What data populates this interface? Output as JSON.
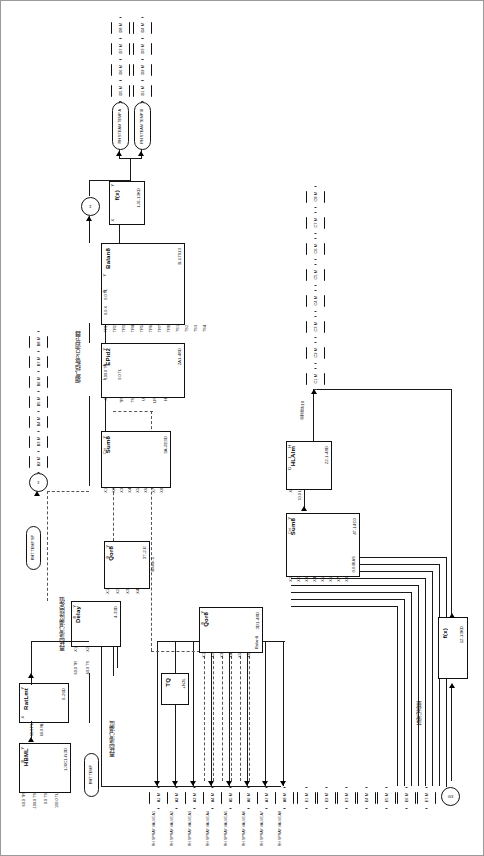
{
  "diagram": {
    "orientation_note": "sheet rotated 90°",
    "annotations": [
      {
        "id": "ann-pid",
        "text": "烟气挡板PID调节器"
      },
      {
        "id": "ann-setval",
        "text": "再热蒸汽温度给定值"
      },
      {
        "id": "ann-temp",
        "text": "再热蒸汽温度"
      },
      {
        "id": "ann-open",
        "text": "总开度<10"
      },
      {
        "id": "ann-load",
        "text": "蒸汽流量"
      }
    ]
  },
  "blocks": [
    {
      "id": "balan8",
      "name": "Balan8",
      "tag": "B-17013",
      "outputs": [
        "Y",
        "B"
      ],
      "inputs": [
        "TR1",
        "TR2",
        "TR3",
        "TR4",
        "TR5",
        "TR6",
        "TR7",
        "TR8",
        "TS1",
        "TS2",
        "TS3",
        "TS4",
        "TS5",
        "TS6",
        "TS7",
        "TS8"
      ],
      "params": [
        "0.0 TL",
        "0.0 X",
        "100.0",
        "100.0",
        "100.0",
        "100.0",
        "-100.0",
        "-100.0",
        "-100.0",
        "-100.0"
      ]
    },
    {
      "id": "epid2",
      "name": "EPid2",
      "tag": "2A1-48D",
      "outputs": [
        "Y",
        "A",
        "L"
      ],
      "inputs": [
        "X",
        "TR",
        "TS",
        "U",
        "LR",
        "H"
      ],
      "params": [
        "100.0 TS",
        "0.0 TL",
        "1.0 PB",
        "0.0 TI",
        "0.0 TD",
        "0.0 B"
      ]
    },
    {
      "id": "sum8a",
      "name": "Sum8",
      "tag": "3A-2E3D",
      "outputs": [
        "Y",
        "Cnt"
      ],
      "inputs": [
        "X1",
        "X2",
        "X3",
        "X4",
        "X5",
        "X6",
        "X7",
        "X8"
      ],
      "params": [
        "1.0 K1",
        "1.0 K2",
        "1.0 K3",
        "1.0 K4",
        "0.0 BIAS"
      ]
    },
    {
      "id": "sum8b",
      "name": "Sum8",
      "tag": "4T-14C0",
      "outputs": [
        "Y",
        "Cnt"
      ],
      "inputs": [
        "X1",
        "X2",
        "X3",
        "X4",
        "X5",
        "X6",
        "X7",
        "X8"
      ],
      "params": [
        "0.0 BIAS"
      ]
    },
    {
      "id": "hlalm",
      "name": "HLAlm",
      "tag": "22-1-48D",
      "outputs": [
        "H",
        "L",
        "D"
      ],
      "inputs": [
        "X"
      ],
      "params": [
        "10.0 L"
      ]
    },
    {
      "id": "qor8a",
      "name": "Qor8",
      "tag": "3T-2-E",
      "outputs": [
        "Y",
        "B"
      ],
      "inputs": [
        "X1",
        "X2",
        "X3",
        "X4"
      ],
      "params": [
        "Balan-1"
      ]
    },
    {
      "id": "qor8b",
      "name": "Qor8",
      "tag": "3D1-48D",
      "outputs": [
        "Y",
        "B"
      ],
      "inputs": [
        "X1",
        "X2",
        "X3",
        "X4",
        "X5",
        "X6"
      ],
      "params": [
        "Balan8"
      ]
    },
    {
      "id": "delay",
      "name": "Delay",
      "tag": "4-33D",
      "outputs": [
        "Y",
        "B"
      ],
      "inputs": [
        "X1",
        "X2"
      ],
      "params": [
        "60.0 TR",
        "-60.0 TS"
      ]
    },
    {
      "id": "ratlmt",
      "name": "RatLmt",
      "tag": "6-26D",
      "outputs": [
        "Y",
        "B"
      ],
      "inputs": [
        "X"
      ],
      "params": [
        "60.0 PL",
        "60.0 NL"
      ]
    },
    {
      "id": "hbml",
      "name": "HBML",
      "tag": "1J6C1-N3D",
      "outputs": [
        "Y",
        "B"
      ],
      "inputs": [
        "TR",
        "TS",
        "TS",
        "TL"
      ],
      "params": [
        "60.0",
        "-100.0",
        "0.0",
        "100.0"
      ]
    },
    {
      "id": "tq",
      "name": "TQ",
      "tag": "+N3L"
    },
    {
      "id": "fx1",
      "name": "f(x)",
      "tag": "1J6-13KD",
      "inputs": [
        "X"
      ],
      "outputs": [
        "Y"
      ]
    },
    {
      "id": "fx2",
      "name": "f(x)",
      "tag": "12-13KD",
      "inputs": [
        "X"
      ],
      "outputs": [
        "Y"
      ]
    },
    {
      "id": "sumcircle",
      "name": "Σ"
    }
  ],
  "pill_tags": [
    {
      "id": "pill-a",
      "text": "RH STEAM TEMP A"
    },
    {
      "id": "pill-b",
      "text": "RH STEAM TEMP B"
    },
    {
      "id": "pill-c",
      "text": "RHT TEMP SP"
    },
    {
      "id": "pill-d",
      "text": "RHT TEMP"
    }
  ],
  "hex_groups": [
    {
      "id": "hex-col-top-left",
      "tags": [
        {
          "label": "D8 M"
        },
        {
          "label": "D7 M"
        },
        {
          "label": "D6 M"
        },
        {
          "label": "D5 M"
        },
        {
          "label": "D4 M"
        },
        {
          "label": "D3 M"
        },
        {
          "label": "D2 M"
        },
        {
          "label": "D1 M"
        }
      ]
    },
    {
      "id": "hex-col-left-mid",
      "tags": [
        {
          "label": "B8 M"
        },
        {
          "label": "B7 M"
        },
        {
          "label": "B6 M"
        },
        {
          "label": "B5 M"
        },
        {
          "label": "B4 M"
        },
        {
          "label": "B3 M"
        },
        {
          "label": "B2 M"
        },
        {
          "label": "B1 M"
        }
      ]
    },
    {
      "id": "hex-col-right-mid",
      "tags": [
        {
          "label": "C8 M"
        },
        {
          "label": "C7 M"
        },
        {
          "label": "C6 M"
        },
        {
          "label": "C5 M"
        },
        {
          "label": "C4 M"
        },
        {
          "label": "C3 M"
        },
        {
          "label": "C2 M"
        },
        {
          "label": "C1 M"
        }
      ]
    },
    {
      "id": "hex-row-bottom",
      "tags": [
        {
          "label": "A1 M",
          "sub": "RH SPRAY VALVE A1"
        },
        {
          "label": "A2 M",
          "sub": "RH SPRAY VALVE A2"
        },
        {
          "label": "A3 M",
          "sub": "RH SPRAY VALVE A3"
        },
        {
          "label": "A4 M",
          "sub": "RH SPRAY VALVE A4"
        },
        {
          "label": "A5 M",
          "sub": "RH SPRAY VALVE A5"
        },
        {
          "label": "A6 M",
          "sub": "RH SPRAY VALVE A6"
        },
        {
          "label": "A7 M",
          "sub": "RH SPRAY VALVE A7"
        },
        {
          "label": "A8 M",
          "sub": "RH SPRAY VALVE A8"
        }
      ]
    },
    {
      "id": "hex-row-bottom-right",
      "tags": [
        {
          "label": "E1 M"
        },
        {
          "label": "E2 M"
        },
        {
          "label": "E3 M"
        },
        {
          "label": "E4 M"
        },
        {
          "label": "E5 M"
        },
        {
          "label": "E6 M"
        },
        {
          "label": "E7 M"
        }
      ]
    }
  ],
  "circle_tags": [
    {
      "id": "circ-top",
      "label": "Σ"
    },
    {
      "id": "circ-left",
      "label": "Σ"
    },
    {
      "id": "circ-bottom-right",
      "label": "G3"
    }
  ],
  "pin_values": {
    "balan8_left": [
      "0.0 TL",
      "0.0 X"
    ],
    "epid2_left": [
      "100.0 TS",
      "0.0 TL"
    ],
    "hlalm_left": [
      "10.0 L"
    ],
    "delay_left": [
      "60.0 TR",
      "-60.0 TS"
    ],
    "ratlmt_left": [
      "60.0 PL",
      "60.0 NL"
    ],
    "hbml_left": [
      "60.0 TR",
      "-100.0 TS",
      "0.0 TS",
      "100.0 TL"
    ]
  }
}
